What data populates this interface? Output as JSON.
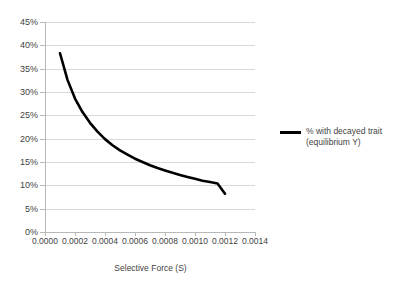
{
  "chart_data": {
    "type": "line",
    "title": "",
    "subtitle": "",
    "xlabel": "Selective Force (S)",
    "ylabel": "",
    "xlim": [
      0.0,
      0.0014
    ],
    "ylim": [
      0,
      45
    ],
    "grid": true,
    "grid_axis": "y",
    "legend_position": "right",
    "x_tick_labels": [
      "0.0000",
      "0.0002",
      "0.0004",
      "0.0006",
      "0.0008",
      "0.0010",
      "0.0012",
      "0.0014"
    ],
    "x_ticks": [
      0.0,
      0.0002,
      0.0004,
      0.0006,
      0.0008,
      0.001,
      0.0012,
      0.0014
    ],
    "y_tick_labels": [
      "0%",
      "5%",
      "10%",
      "15%",
      "20%",
      "25%",
      "30%",
      "35%",
      "40%",
      "45%"
    ],
    "y_ticks": [
      0,
      5,
      10,
      15,
      20,
      25,
      30,
      35,
      40,
      45
    ],
    "series": [
      {
        "name": "% with decayed trait (equilibrium Y)",
        "color": "#000000",
        "line_width": 2.6,
        "x": [
          0.0001,
          0.00015,
          0.0002,
          0.00025,
          0.0003,
          0.00035,
          0.0004,
          0.00045,
          0.0005,
          0.00055,
          0.0006,
          0.00065,
          0.0007,
          0.00075,
          0.0008,
          0.00085,
          0.0009,
          0.00095,
          0.001,
          0.00105,
          0.0011,
          0.00115,
          0.0012
        ],
        "values": [
          38.3,
          32.6,
          28.6,
          25.7,
          23.4,
          21.5,
          19.9,
          18.6,
          17.5,
          16.6,
          15.7,
          15.0,
          14.3,
          13.7,
          13.2,
          12.7,
          12.2,
          11.8,
          11.4,
          11.0,
          10.7,
          10.4,
          8.2
        ]
      }
    ]
  },
  "legend": {
    "entries": [
      {
        "line1": "% with decayed trait",
        "line2": "(equilibrium Y)",
        "color": "#000000"
      }
    ]
  },
  "colors": {
    "series": "#000000",
    "gridline": "#d9d9d9",
    "axis": "#b8b8b8",
    "text": "#3f3f3f",
    "background": "#ffffff"
  }
}
